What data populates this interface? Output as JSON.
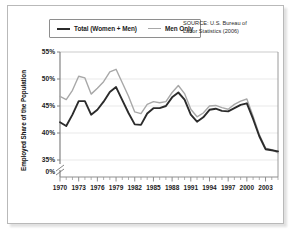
{
  "figure": {
    "source_note_line1": "SOURCE: U.S. Bureau of",
    "source_note_line2": "Labor Statistics (2006)"
  },
  "chart_data": {
    "type": "line",
    "title": "",
    "xlabel": "",
    "ylabel": "Employed Share of the Population",
    "xlim": [
      1970,
      2005
    ],
    "ylim": [
      35,
      55
    ],
    "grid": true,
    "axis_break": true,
    "zero_tick_label": "0%",
    "ytick_labels": [
      "55%",
      "50%",
      "45%",
      "40%",
      "35%"
    ],
    "ytick_values": [
      55,
      50,
      45,
      40,
      35
    ],
    "xtick_labels": [
      "1970",
      "1973",
      "1976",
      "1979",
      "1982",
      "1985",
      "1988",
      "1991",
      "1994",
      "1997",
      "2000",
      "2003"
    ],
    "xtick_values": [
      1970,
      1973,
      1976,
      1979,
      1982,
      1985,
      1988,
      1991,
      1994,
      1997,
      2000,
      2003
    ],
    "minor_xticks_every": 1,
    "legend_position": "top-left",
    "x": [
      1970,
      1971,
      1972,
      1973,
      1974,
      1975,
      1976,
      1977,
      1978,
      1979,
      1980,
      1981,
      1982,
      1983,
      1984,
      1985,
      1986,
      1987,
      1988,
      1989,
      1990,
      1991,
      1992,
      1993,
      1994,
      1995,
      1996,
      1997,
      1998,
      1999,
      2000,
      2001,
      2002,
      2003,
      2004,
      2005
    ],
    "series": [
      {
        "name": "Total (Women + Men)",
        "color": "#2b2b2b",
        "values": [
          42.0,
          41.3,
          43.4,
          45.9,
          45.9,
          43.4,
          44.3,
          45.8,
          47.6,
          48.5,
          46.1,
          43.7,
          41.6,
          41.5,
          43.6,
          44.6,
          44.6,
          45.0,
          46.6,
          47.5,
          46.2,
          43.4,
          42.1,
          42.9,
          44.3,
          44.5,
          44.1,
          44.0,
          44.6,
          45.2,
          45.5,
          42.6,
          39.4,
          37.0,
          36.8,
          36.6
        ]
      },
      {
        "name": "Men Only",
        "color": "#a8a8a8",
        "values": [
          46.8,
          46.2,
          47.9,
          50.5,
          50.2,
          47.2,
          48.3,
          49.5,
          51.3,
          51.8,
          49.3,
          46.8,
          43.9,
          43.6,
          45.3,
          45.8,
          45.6,
          45.8,
          47.5,
          48.8,
          47.3,
          44.4,
          43.0,
          43.7,
          45.0,
          45.1,
          44.7,
          44.4,
          45.3,
          45.9,
          46.3,
          43.1,
          39.7,
          37.2,
          36.9,
          36.3
        ]
      }
    ]
  },
  "legend": {
    "items": [
      {
        "label": "Total (Women + Men)"
      },
      {
        "label": "Men Only"
      }
    ]
  }
}
